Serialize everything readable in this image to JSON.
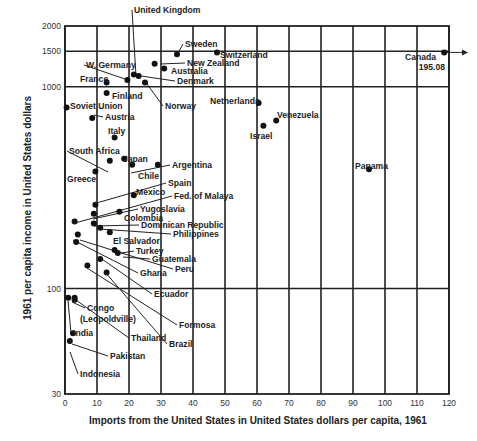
{
  "chart_data": {
    "type": "scatter",
    "title": "",
    "xlabel": "Imports from the United States in United States dollars per capita, 1961",
    "ylabel": "1961 per capita income in United States dollars",
    "xlim": [
      0,
      120
    ],
    "ylim": [
      30,
      2000
    ],
    "yscale": "log",
    "x_ticks": [
      0,
      10,
      20,
      30,
      40,
      50,
      60,
      70,
      80,
      90,
      100,
      110,
      120
    ],
    "y_ticks": [
      30,
      100,
      1000,
      1500,
      2000
    ],
    "grid": true,
    "legend": null,
    "annotations": [
      {
        "text": "Canada 195.08",
        "note": "off-scale point, arrow pointing right at x=120"
      }
    ],
    "points": [
      {
        "label": "Canada",
        "x": 195.08,
        "y": 1480,
        "display_x": 118.5
      },
      {
        "label": "United Kingdom",
        "x": 21.5,
        "y": 1150
      },
      {
        "label": "Sweden",
        "x": 35,
        "y": 1450
      },
      {
        "label": "Switzerland",
        "x": 47.5,
        "y": 1480
      },
      {
        "label": "New Zealand",
        "x": 28,
        "y": 1300
      },
      {
        "label": "Australia",
        "x": 31,
        "y": 1230
      },
      {
        "label": "Denmark",
        "x": 23,
        "y": 1130
      },
      {
        "label": "W. Germany",
        "x": 19.5,
        "y": 1080
      },
      {
        "label": "Norway",
        "x": 25,
        "y": 1050
      },
      {
        "label": "France",
        "x": 13,
        "y": 1050
      },
      {
        "label": "Finland",
        "x": 13,
        "y": 930
      },
      {
        "label": "Soviet Union",
        "x": 0.5,
        "y": 790
      },
      {
        "label": "Austria",
        "x": 8.5,
        "y": 700
      },
      {
        "label": "Italy",
        "x": 15.5,
        "y": 560
      },
      {
        "label": "Netherlands",
        "x": 60.5,
        "y": 830
      },
      {
        "label": "Venezuela",
        "x": 66,
        "y": 680
      },
      {
        "label": "Israel",
        "x": 62,
        "y": 640
      },
      {
        "label": "Panama",
        "x": 95,
        "y": 390
      },
      {
        "label": "South Africa",
        "x": 14,
        "y": 430
      },
      {
        "label": "Japan",
        "x": 18.5,
        "y": 440
      },
      {
        "label": "Argentina",
        "x": 21,
        "y": 410
      },
      {
        "label": "Chile",
        "x": 29,
        "y": 410
      },
      {
        "label": "Greece",
        "x": 9.5,
        "y": 380
      },
      {
        "label": "Spain",
        "x": 9.5,
        "y": 260
      },
      {
        "label": "Mexico",
        "x": 21.5,
        "y": 290
      },
      {
        "label": "Fed. of Malaya",
        "x": 3,
        "y": 215
      },
      {
        "label": "Yugoslavia",
        "x": 9,
        "y": 235
      },
      {
        "label": "Colombia",
        "x": 17,
        "y": 240
      },
      {
        "label": "Dominican Republic",
        "x": 9,
        "y": 210
      },
      {
        "label": "Philippines",
        "x": 11,
        "y": 200
      },
      {
        "label": "El Salvador",
        "x": 14,
        "y": 190
      },
      {
        "label": "Turkey",
        "x": 15.5,
        "y": 155
      },
      {
        "label": "Guatemala",
        "x": 16.5,
        "y": 150
      },
      {
        "label": "Peru",
        "x": 4,
        "y": 185
      },
      {
        "label": "Ghana",
        "x": 3.5,
        "y": 170
      },
      {
        "label": "Ecuador",
        "x": 11,
        "y": 140
      },
      {
        "label": "Formosa",
        "x": 7,
        "y": 130
      },
      {
        "label": "Brazil",
        "x": 13,
        "y": 120
      },
      {
        "label": "Thailand",
        "x": 3,
        "y": 90
      },
      {
        "label": "Congo (Leopoldville)",
        "x": 3,
        "y": 88
      },
      {
        "label": "India",
        "x": 1,
        "y": 90
      },
      {
        "label": "Pakistan",
        "x": 2.5,
        "y": 60
      },
      {
        "label": "Indonesia",
        "x": 1.5,
        "y": 55
      }
    ]
  },
  "labels": {
    "x_axis_title": "Imports from the United States in United States dollars per capita, 1961",
    "y_axis_title": "1961 per capita income in United States dollars",
    "canada_value": "195.08"
  }
}
